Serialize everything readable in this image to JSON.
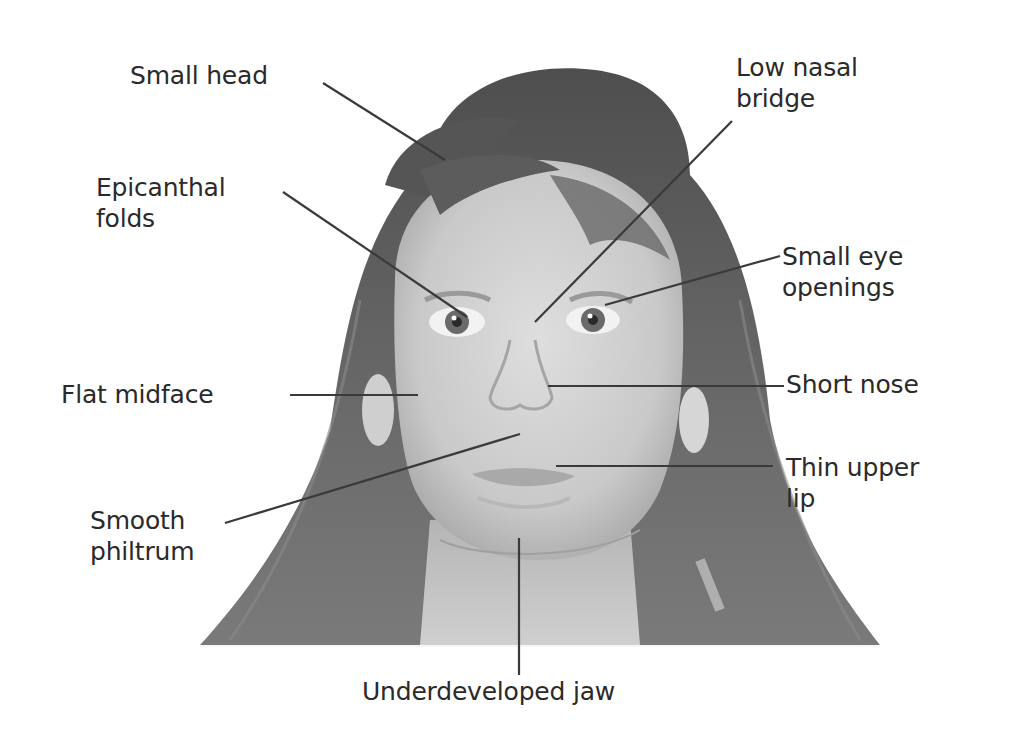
{
  "figure": {
    "background_color": "#ffffff",
    "text_color": "#2a2a2a",
    "line_color": "#3a3a3a"
  },
  "labels": {
    "small_head": {
      "lines": [
        "Small head"
      ]
    },
    "low_nasal_bridge": {
      "lines": [
        "Low nasal",
        "bridge"
      ]
    },
    "epicanthal_folds": {
      "lines": [
        "Epicanthal",
        "folds"
      ]
    },
    "small_eye_openings": {
      "lines": [
        "Small eye",
        "openings"
      ]
    },
    "flat_midface": {
      "lines": [
        "Flat midface"
      ]
    },
    "short_nose": {
      "lines": [
        "Short nose"
      ]
    },
    "smooth_philtrum": {
      "lines": [
        "Smooth",
        "philtrum"
      ]
    },
    "thin_upper_lip": {
      "lines": [
        "Thin upper",
        "lip"
      ]
    },
    "underdeveloped_jaw": {
      "lines": [
        "Underdeveloped jaw"
      ]
    }
  }
}
